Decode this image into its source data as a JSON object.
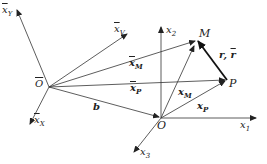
{
  "diagram": {
    "points": {
      "O_bar": {
        "label": "O",
        "overline": true,
        "x": 49,
        "y": 87
      },
      "O": {
        "label": "O",
        "x": 161,
        "y": 118
      },
      "M": {
        "label": "M",
        "x": 197,
        "y": 40
      },
      "P": {
        "label": "P",
        "x": 227,
        "y": 80
      }
    },
    "axes_moving": [
      {
        "label": "x̄_Y",
        "text": "x",
        "sub": "Y",
        "to": [
          17,
          10
        ]
      },
      {
        "label": "x̄_V",
        "text": "x",
        "sub": "V",
        "to": [
          127,
          34
        ]
      },
      {
        "label": "x̄_X",
        "text": "x",
        "sub": "X",
        "to": [
          30,
          124
        ]
      }
    ],
    "axes_fixed": [
      {
        "label": "x_1",
        "text": "x",
        "sub": "1",
        "to": [
          256,
          118
        ]
      },
      {
        "label": "x_2",
        "text": "x",
        "sub": "2",
        "to": [
          161,
          27
        ]
      },
      {
        "label": "x_3",
        "text": "x",
        "sub": "3",
        "to": [
          134,
          152
        ]
      }
    ],
    "vectors": [
      {
        "label": "x̄_M",
        "from": "O_bar",
        "to": "M"
      },
      {
        "label": "x̄_P",
        "from": "O_bar",
        "to": "P"
      },
      {
        "label": "b",
        "from": "O_bar",
        "to": "O"
      },
      {
        "label": "x_M",
        "from": "O",
        "to": "M"
      },
      {
        "label": "x_P",
        "from": "O",
        "to": "P"
      },
      {
        "label": "r, r̄",
        "from": "P",
        "to": "M",
        "bold": true
      }
    ],
    "labels": {
      "xY": "x",
      "xY_sub": "Y",
      "xV": "x",
      "xV_sub": "V",
      "xX": "x",
      "xX_sub": "X",
      "x1": "x",
      "x1_sub": "1",
      "x2": "x",
      "x2_sub": "2",
      "x3": "x",
      "x3_sub": "3",
      "O_bar": "O",
      "O": "O",
      "M": "M",
      "P": "P",
      "xM_bar": "x",
      "xM_bar_sub": "M",
      "xP_bar": "x",
      "xP_bar_sub": "P",
      "b": "b",
      "xM": "x",
      "xM_sub": "M",
      "xP": "x",
      "xP_sub": "P",
      "r": "r,",
      "r_bar": "r"
    }
  }
}
